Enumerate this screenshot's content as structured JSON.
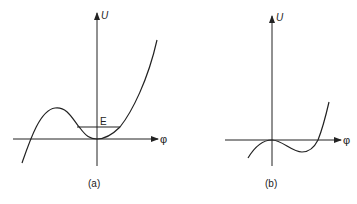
{
  "panels": [
    {
      "id": "a",
      "caption": "(a)",
      "y_axis_label": "U",
      "x_axis_label": "φ",
      "energy_level_label": "E",
      "description": "Potential U(φ) with local minimum at origin and a barrier on the left; horizontal line E marks energy level inside the well"
    },
    {
      "id": "b",
      "caption": "(b)",
      "y_axis_label": "U",
      "x_axis_label": "φ",
      "description": "Potential U(φ) with inflection/flat point at origin, dipping below axis to a minimum and rising steeply"
    }
  ],
  "colors": {
    "stroke": "#222222",
    "background": "#ffffff"
  }
}
